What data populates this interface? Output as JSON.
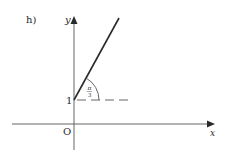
{
  "figure": {
    "part_label": "h)",
    "x_axis_label": "x",
    "y_axis_label": "y",
    "origin_label": "O",
    "y_intercept_label": "1",
    "angle_label_num": "π",
    "angle_label_den": "3",
    "angle_description": "π/3",
    "ray": {
      "start": [
        0,
        1
      ],
      "direction_angle": "π/3"
    },
    "colors": {
      "stroke": "#2a2a2a",
      "background": "#ffffff"
    }
  }
}
